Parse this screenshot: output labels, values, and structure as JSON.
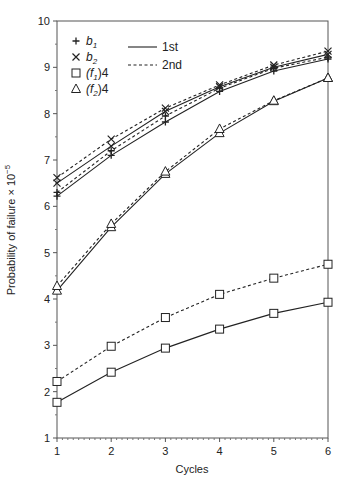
{
  "chart_data": {
    "type": "line",
    "title": "",
    "xlabel": "Cycles",
    "ylabel": "Probability of failure × 10",
    "ylabel_exponent": "−5",
    "x": [
      1,
      2,
      3,
      4,
      5,
      6
    ],
    "xlim": [
      1,
      6
    ],
    "ylim": [
      1,
      10
    ],
    "x_ticks": [
      "1",
      "2",
      "3",
      "4",
      "5",
      "6"
    ],
    "y_ticks": [
      "1",
      "2",
      "3",
      "4",
      "5",
      "6",
      "7",
      "8",
      "9",
      "10"
    ],
    "grid": false,
    "legend_position": "upper-left",
    "marker_legend": [
      {
        "marker": "plus",
        "label": "b",
        "sub": "1",
        "suffix": ""
      },
      {
        "marker": "cross",
        "label": "b",
        "sub": "2",
        "suffix": ""
      },
      {
        "marker": "square",
        "label": "(f",
        "sub": "1",
        "suffix": ")4"
      },
      {
        "marker": "triangle",
        "label": "(f",
        "sub": "2",
        "suffix": ")4"
      }
    ],
    "line_legend": [
      {
        "style": "solid",
        "label": "1st"
      },
      {
        "style": "dashed",
        "label": "2nd"
      }
    ],
    "series": [
      {
        "name": "b1 1st",
        "marker": "plus",
        "style": "solid",
        "values": [
          6.22,
          7.1,
          7.82,
          8.48,
          8.92,
          9.18
        ]
      },
      {
        "name": "b1 2nd",
        "marker": "plus",
        "style": "dashed",
        "values": [
          6.3,
          7.2,
          7.95,
          8.55,
          8.98,
          9.22
        ]
      },
      {
        "name": "b2 1st",
        "marker": "cross",
        "style": "solid",
        "values": [
          6.5,
          7.3,
          8.05,
          8.58,
          9.0,
          9.28
        ]
      },
      {
        "name": "b2 2nd",
        "marker": "cross",
        "style": "dashed",
        "values": [
          6.62,
          7.45,
          8.12,
          8.62,
          9.05,
          9.35
        ]
      },
      {
        "name": "(f1)4 1st",
        "marker": "square",
        "style": "solid",
        "values": [
          1.77,
          2.42,
          2.94,
          3.35,
          3.69,
          3.93
        ]
      },
      {
        "name": "(f1)4 2nd",
        "marker": "square",
        "style": "dashed",
        "values": [
          2.22,
          2.98,
          3.6,
          4.1,
          4.45,
          4.75
        ]
      },
      {
        "name": "(f2)4 1st",
        "marker": "triangle",
        "style": "solid",
        "values": [
          4.18,
          5.55,
          6.7,
          7.58,
          8.27,
          8.77
        ]
      },
      {
        "name": "(f2)4 2nd",
        "marker": "triangle",
        "style": "dashed",
        "values": [
          4.28,
          5.62,
          6.75,
          7.67,
          8.28,
          8.77
        ]
      }
    ],
    "colors": {
      "line": "#222222",
      "frame": "#555555"
    }
  }
}
